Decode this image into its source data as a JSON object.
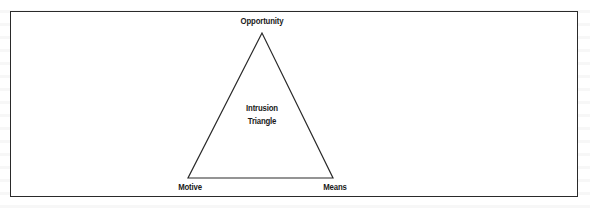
{
  "diagram": {
    "title": "Intrusion Triangle",
    "center_label_line1": "Intrusion",
    "center_label_line2": "Triangle",
    "vertices": {
      "top": "Opportunity",
      "bottom_left": "Motive",
      "bottom_right": "Means"
    },
    "colors": {
      "line": "#2a2a2a",
      "text": "#1a1a1a",
      "background": "#ffffff"
    }
  }
}
